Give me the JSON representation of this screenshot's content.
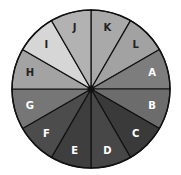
{
  "wheel": {
    "center": [
      91,
      89
    ],
    "radius": 79,
    "segments": [
      {
        "label": "K",
        "fill": "#a9a9a9",
        "text": "#222222"
      },
      {
        "label": "L",
        "fill": "#a2a2a2",
        "text": "#222222"
      },
      {
        "label": "A",
        "fill": "#7d7d7d",
        "text": "#ffffff"
      },
      {
        "label": "B",
        "fill": "#6c6c6c",
        "text": "#ffffff"
      },
      {
        "label": "C",
        "fill": "#3a3a3a",
        "text": "#ffffff"
      },
      {
        "label": "D",
        "fill": "#474747",
        "text": "#ffffff"
      },
      {
        "label": "E",
        "fill": "#3e3e3e",
        "text": "#ffffff"
      },
      {
        "label": "F",
        "fill": "#4c4c4c",
        "text": "#ffffff"
      },
      {
        "label": "G",
        "fill": "#767676",
        "text": "#ffffff"
      },
      {
        "label": "H",
        "fill": "#a3a3a3",
        "text": "#222222"
      },
      {
        "label": "I",
        "fill": "#d6d6d6",
        "text": "#222222"
      },
      {
        "label": "J",
        "fill": "#b2b2b2",
        "text": "#222222"
      }
    ]
  }
}
